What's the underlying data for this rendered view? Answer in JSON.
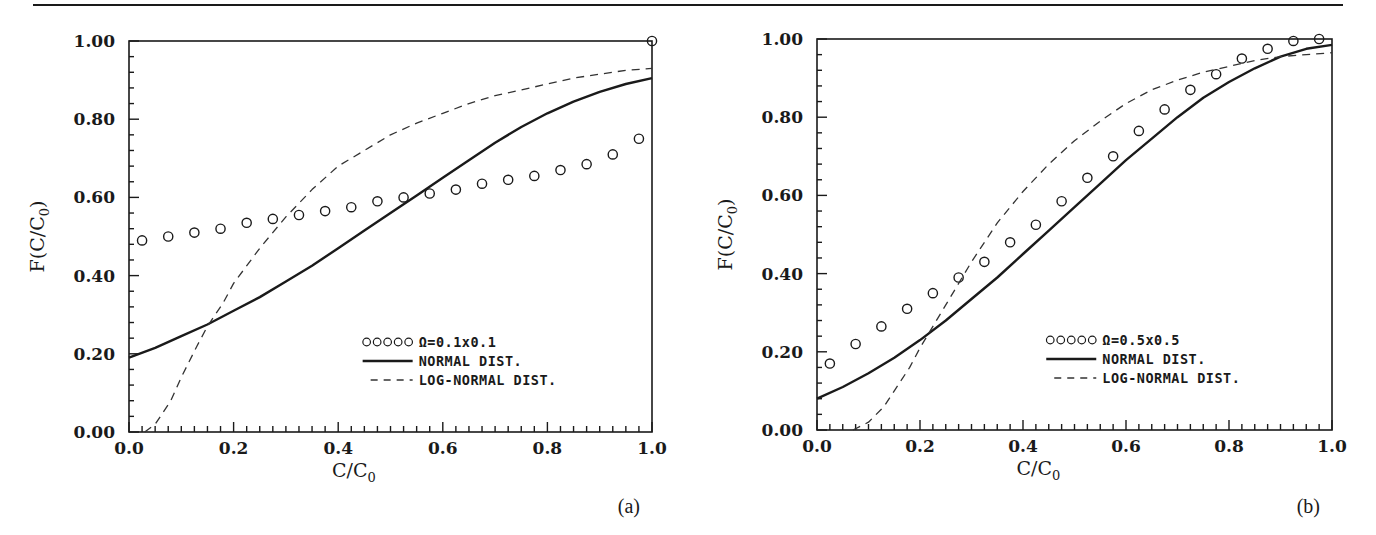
{
  "figure": {
    "top_rule": true,
    "panels": [
      "(a)",
      "(b)"
    ]
  },
  "chart_data": [
    {
      "type": "line",
      "panel_label": "(a)",
      "title": "",
      "xlabel": "C/C0",
      "ylabel": "F(C/C0)",
      "xlim": [
        0.0,
        1.0
      ],
      "ylim": [
        0.0,
        1.0
      ],
      "x_ticks": [
        "0.0",
        "0.2",
        "0.4",
        "0.6",
        "0.8",
        "1.0"
      ],
      "y_ticks": [
        "0.00",
        "0.20",
        "0.40",
        "0.60",
        "0.80",
        "1.00"
      ],
      "grid": false,
      "legend_position": "lower right",
      "legend": [
        {
          "marker": "ooooo",
          "label": "Ω=0.1x0.1"
        },
        {
          "style": "solid",
          "label": "NORMAL DIST."
        },
        {
          "style": "dashed",
          "label": "LOG-NORMAL DIST."
        }
      ],
      "series": [
        {
          "name": "Ω=0.1x0.1",
          "style": "markers",
          "x": [
            0.025,
            0.075,
            0.125,
            0.175,
            0.225,
            0.275,
            0.325,
            0.375,
            0.425,
            0.475,
            0.525,
            0.575,
            0.625,
            0.675,
            0.725,
            0.775,
            0.825,
            0.875,
            0.925,
            0.975,
            1.0
          ],
          "y": [
            0.49,
            0.5,
            0.51,
            0.52,
            0.535,
            0.545,
            0.555,
            0.565,
            0.575,
            0.59,
            0.6,
            0.61,
            0.62,
            0.635,
            0.645,
            0.655,
            0.67,
            0.685,
            0.71,
            0.75,
            1.0
          ]
        },
        {
          "name": "NORMAL DIST.",
          "style": "solid",
          "x": [
            0.0,
            0.05,
            0.1,
            0.15,
            0.2,
            0.25,
            0.3,
            0.35,
            0.4,
            0.45,
            0.5,
            0.55,
            0.6,
            0.65,
            0.7,
            0.75,
            0.8,
            0.85,
            0.9,
            0.95,
            1.0
          ],
          "y": [
            0.19,
            0.215,
            0.245,
            0.275,
            0.31,
            0.345,
            0.385,
            0.425,
            0.47,
            0.515,
            0.56,
            0.605,
            0.65,
            0.695,
            0.74,
            0.78,
            0.815,
            0.845,
            0.87,
            0.89,
            0.905
          ]
        },
        {
          "name": "LOG-NORMAL DIST.",
          "style": "dashed",
          "x": [
            0.03,
            0.05,
            0.08,
            0.1,
            0.13,
            0.15,
            0.18,
            0.2,
            0.25,
            0.3,
            0.35,
            0.4,
            0.45,
            0.5,
            0.55,
            0.6,
            0.65,
            0.7,
            0.75,
            0.8,
            0.85,
            0.9,
            0.95,
            1.0
          ],
          "y": [
            0.0,
            0.02,
            0.08,
            0.14,
            0.22,
            0.27,
            0.33,
            0.38,
            0.47,
            0.55,
            0.62,
            0.68,
            0.72,
            0.76,
            0.79,
            0.815,
            0.84,
            0.86,
            0.875,
            0.89,
            0.905,
            0.915,
            0.925,
            0.93
          ]
        }
      ]
    },
    {
      "type": "line",
      "panel_label": "(b)",
      "title": "",
      "xlabel": "C/C0",
      "ylabel": "F(C/C0)",
      "xlim": [
        0.0,
        1.0
      ],
      "ylim": [
        0.0,
        1.0
      ],
      "x_ticks": [
        "0.0",
        "0.2",
        "0.4",
        "0.6",
        "0.8",
        "1.0"
      ],
      "y_ticks": [
        "0.00",
        "0.20",
        "0.40",
        "0.60",
        "0.80",
        "1.00"
      ],
      "grid": false,
      "legend_position": "lower right",
      "legend": [
        {
          "marker": "ooooo",
          "label": "Ω=0.5x0.5"
        },
        {
          "style": "solid",
          "label": "NORMAL DIST."
        },
        {
          "style": "dashed",
          "label": "LOG-NORMAL DIST."
        }
      ],
      "series": [
        {
          "name": "Ω=0.5x0.5",
          "style": "markers",
          "x": [
            0.025,
            0.075,
            0.125,
            0.175,
            0.225,
            0.275,
            0.325,
            0.375,
            0.425,
            0.475,
            0.525,
            0.575,
            0.625,
            0.675,
            0.725,
            0.775,
            0.825,
            0.875,
            0.925,
            0.975
          ],
          "y": [
            0.17,
            0.22,
            0.265,
            0.31,
            0.35,
            0.39,
            0.43,
            0.48,
            0.525,
            0.585,
            0.645,
            0.7,
            0.765,
            0.82,
            0.87,
            0.91,
            0.95,
            0.975,
            0.995,
            1.0
          ]
        },
        {
          "name": "NORMAL DIST.",
          "style": "solid",
          "x": [
            0.0,
            0.05,
            0.1,
            0.15,
            0.2,
            0.25,
            0.3,
            0.35,
            0.4,
            0.45,
            0.5,
            0.55,
            0.6,
            0.65,
            0.7,
            0.75,
            0.8,
            0.85,
            0.9,
            0.95,
            1.0
          ],
          "y": [
            0.08,
            0.11,
            0.145,
            0.185,
            0.23,
            0.28,
            0.335,
            0.39,
            0.45,
            0.51,
            0.57,
            0.63,
            0.69,
            0.745,
            0.8,
            0.85,
            0.89,
            0.925,
            0.955,
            0.975,
            0.985
          ]
        },
        {
          "name": "LOG-NORMAL DIST.",
          "style": "dashed",
          "x": [
            0.07,
            0.1,
            0.13,
            0.15,
            0.18,
            0.2,
            0.25,
            0.3,
            0.35,
            0.4,
            0.45,
            0.5,
            0.55,
            0.6,
            0.65,
            0.7,
            0.75,
            0.8,
            0.85,
            0.9,
            0.95,
            1.0
          ],
          "y": [
            0.0,
            0.02,
            0.06,
            0.1,
            0.16,
            0.21,
            0.32,
            0.43,
            0.53,
            0.61,
            0.68,
            0.74,
            0.79,
            0.835,
            0.87,
            0.895,
            0.915,
            0.93,
            0.945,
            0.955,
            0.96,
            0.965
          ]
        }
      ]
    }
  ],
  "layout": {
    "panels": [
      {
        "x0": 129,
        "x1": 652,
        "y0": 432,
        "y1": 41,
        "label_x": 640,
        "label_y": 513
      },
      {
        "x0": 817,
        "x1": 1332,
        "y0": 430,
        "y1": 39,
        "label_x": 1320,
        "label_y": 513
      }
    ],
    "rule": {
      "x1": 33,
      "x2": 1343,
      "y": 5
    },
    "ink": "#1a1a1a",
    "dash_ink": "#333333"
  }
}
